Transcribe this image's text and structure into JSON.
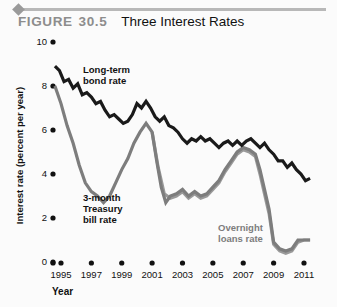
{
  "header": {
    "figure_label": "FIGURE",
    "figure_number": "30.5",
    "title": "Three Interest Rates",
    "rule_color": "#b8b8b8",
    "label_color": "#8d8d8d"
  },
  "chart_data": {
    "type": "line",
    "title": "Three Interest Rates",
    "xlabel": "Year",
    "ylabel": "Interest rate (percent per year)",
    "xlim": [
      1994.5,
      2011.5
    ],
    "ylim": [
      0,
      10
    ],
    "xticks": [
      1995,
      1997,
      1999,
      2001,
      2003,
      2005,
      2007,
      2009,
      2011
    ],
    "yticks": [
      0,
      2,
      4,
      6,
      8,
      10
    ],
    "grid": false,
    "legend": "annotations-inline",
    "tick_marker": "dot",
    "series": [
      {
        "name": "Long-term bond rate",
        "color": "#1a1a1a",
        "label_color": "#111111",
        "x": [
          1994.6,
          1994.9,
          1995.2,
          1995.5,
          1995.8,
          1996.1,
          1996.4,
          1996.7,
          1997.0,
          1997.3,
          1997.6,
          1997.9,
          1998.2,
          1998.5,
          1998.8,
          1999.1,
          1999.4,
          1999.7,
          2000.0,
          2000.3,
          2000.6,
          2000.9,
          2001.2,
          2001.5,
          2001.8,
          2002.1,
          2002.4,
          2002.7,
          2003.0,
          2003.3,
          2003.6,
          2003.9,
          2004.2,
          2004.5,
          2004.8,
          2005.1,
          2005.4,
          2005.7,
          2006.0,
          2006.3,
          2006.6,
          2006.9,
          2007.2,
          2007.5,
          2007.8,
          2008.1,
          2008.4,
          2008.7,
          2009.0,
          2009.3,
          2009.6,
          2009.9,
          2010.2,
          2010.5,
          2010.8,
          2011.1,
          2011.4
        ],
        "y": [
          8.9,
          8.7,
          8.2,
          8.3,
          7.9,
          8.1,
          7.6,
          7.7,
          7.5,
          7.2,
          7.3,
          6.9,
          6.6,
          6.7,
          6.5,
          6.3,
          6.4,
          6.7,
          7.2,
          7.0,
          7.3,
          7.0,
          6.6,
          6.4,
          6.6,
          6.2,
          6.1,
          5.9,
          5.6,
          5.4,
          5.6,
          5.5,
          5.7,
          5.5,
          5.6,
          5.4,
          5.2,
          5.4,
          5.5,
          5.3,
          5.5,
          5.3,
          5.5,
          5.6,
          5.4,
          5.2,
          5.4,
          5.1,
          4.9,
          4.6,
          4.6,
          4.3,
          4.5,
          4.2,
          4.0,
          3.7,
          3.8
        ]
      },
      {
        "name": "3-month Treasury bill rate",
        "color": "#7d7d7d",
        "label_color": "#111111",
        "x": [
          1994.6,
          1995.0,
          1995.4,
          1995.8,
          1996.2,
          1996.6,
          1997.0,
          1997.4,
          1997.8,
          1998.2,
          1998.6,
          1999.0,
          1999.4,
          1999.8,
          2000.2,
          2000.6,
          2001.0,
          2001.3,
          2001.6,
          2001.9,
          2002.2,
          2002.6,
          2003.0,
          2003.4,
          2003.8,
          2004.2,
          2004.6,
          2005.0,
          2005.4,
          2005.8,
          2006.2,
          2006.6,
          2007.0,
          2007.4,
          2007.8,
          2008.1,
          2008.4,
          2008.7,
          2009.0,
          2009.4,
          2009.8,
          2010.2,
          2010.6,
          2011.0,
          2011.4
        ],
        "y": [
          8.0,
          7.2,
          6.2,
          5.4,
          4.4,
          3.6,
          3.2,
          3.0,
          2.7,
          3.0,
          3.6,
          4.2,
          4.7,
          5.4,
          5.9,
          6.3,
          5.9,
          4.6,
          3.4,
          2.7,
          3.0,
          3.1,
          3.3,
          3.0,
          3.2,
          3.0,
          3.1,
          3.4,
          3.7,
          4.2,
          4.6,
          5.0,
          5.2,
          5.1,
          4.9,
          4.2,
          3.3,
          2.4,
          0.9,
          0.6,
          0.5,
          0.6,
          1.0,
          1.0,
          1.0
        ]
      },
      {
        "name": "Overnight loans rate",
        "color": "#9a9a9a",
        "label_color": "#7d7d7d",
        "x": [
          2001.0,
          2001.4,
          2001.8,
          2002.2,
          2002.6,
          2003.0,
          2003.4,
          2003.8,
          2004.2,
          2004.6,
          2005.0,
          2005.4,
          2005.8,
          2006.2,
          2006.6,
          2007.0,
          2007.4,
          2007.8,
          2008.1,
          2008.4,
          2008.7,
          2009.0,
          2009.4,
          2009.8,
          2010.2,
          2010.6,
          2011.0,
          2011.4
        ],
        "y": [
          5.9,
          4.3,
          3.1,
          2.9,
          3.0,
          3.2,
          2.9,
          3.1,
          2.9,
          3.0,
          3.3,
          3.6,
          4.1,
          4.5,
          4.9,
          5.1,
          5.0,
          4.8,
          4.0,
          3.1,
          2.2,
          0.8,
          0.5,
          0.4,
          0.5,
          0.9,
          1.0,
          1.0
        ]
      }
    ],
    "annotations": [
      {
        "id": "bond",
        "text": "Long-term\nbond rate",
        "color": "#111111"
      },
      {
        "id": "tbill",
        "text": "3-month\nTreasury\nbill rate",
        "color": "#111111"
      },
      {
        "id": "overnight",
        "text": "Overnight\nloans rate",
        "color": "#7d7d7d"
      }
    ]
  }
}
